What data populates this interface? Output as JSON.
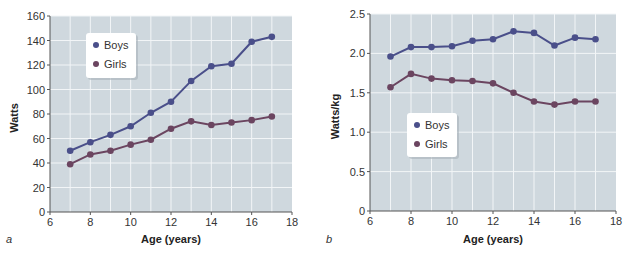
{
  "chart_data": [
    {
      "type": "line",
      "panel_label": "a",
      "title": "",
      "xlabel": "Age (years)",
      "ylabel": "Watts",
      "xlim": [
        6,
        18
      ],
      "ylim": [
        0,
        160
      ],
      "xticks": [
        6,
        8,
        10,
        12,
        14,
        16,
        18
      ],
      "yticks": [
        0,
        20,
        40,
        60,
        80,
        100,
        120,
        140,
        160
      ],
      "x_grid_step": 1,
      "grid": true,
      "legend_position": "top-left",
      "x": [
        7,
        8,
        9,
        10,
        11,
        12,
        13,
        14,
        15,
        16,
        17
      ],
      "series": [
        {
          "name": "Boys",
          "color": "#4a4f8a",
          "values": [
            50,
            57,
            63,
            70,
            81,
            90,
            107,
            119,
            121,
            139,
            143
          ]
        },
        {
          "name": "Girls",
          "color": "#6b4560",
          "values": [
            39,
            47,
            50,
            55,
            59,
            68,
            74,
            71,
            73,
            75,
            78
          ]
        }
      ]
    },
    {
      "type": "line",
      "panel_label": "b",
      "title": "",
      "xlabel": "Age (years)",
      "ylabel": "Watts/kg",
      "xlim": [
        6,
        18
      ],
      "ylim": [
        0,
        2.5
      ],
      "xticks": [
        6,
        8,
        10,
        12,
        14,
        16,
        18
      ],
      "yticks": [
        0,
        0.5,
        1.0,
        1.5,
        2.0,
        2.5
      ],
      "ytick_labels": [
        "0",
        "0.5",
        "1.0",
        "1.5",
        "2.0",
        "2.5"
      ],
      "x_grid_step": 1,
      "grid": true,
      "legend_position": "center-left",
      "x": [
        7,
        8,
        9,
        10,
        11,
        12,
        13,
        14,
        15,
        16,
        17
      ],
      "series": [
        {
          "name": "Boys",
          "color": "#4a4f8a",
          "values": [
            1.96,
            2.08,
            2.08,
            2.09,
            2.16,
            2.18,
            2.28,
            2.26,
            2.1,
            2.2,
            2.18
          ]
        },
        {
          "name": "Girls",
          "color": "#6b4560",
          "values": [
            1.57,
            1.74,
            1.68,
            1.66,
            1.65,
            1.62,
            1.5,
            1.39,
            1.35,
            1.39,
            1.39
          ]
        }
      ]
    }
  ],
  "style": {
    "plot_background": "#cfd8de",
    "grid_color": "#f2f5f7",
    "axis_color": "#555555"
  }
}
